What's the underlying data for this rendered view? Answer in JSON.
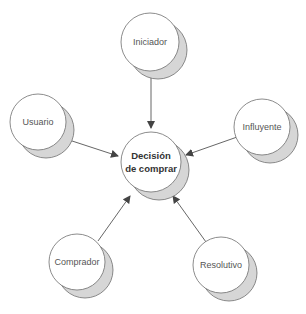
{
  "diagram": {
    "type": "role-diagram",
    "colors": {
      "circle_fill": "#ffffff",
      "circle_stroke": "#6e6e6e",
      "shadow_fill": "#d6d6d6",
      "arrow": "#555555",
      "center_text": "#333333",
      "node_text": "#555555"
    },
    "center": {
      "label_line1": "Decisión",
      "label_line2": "de comprar",
      "cx": 151,
      "cy": 162,
      "r": 30
    },
    "nodes": [
      {
        "id": "iniciador",
        "label": "Iniciador",
        "cx": 150,
        "cy": 42,
        "r": 29
      },
      {
        "id": "usuario",
        "label": "Usuario",
        "cx": 38,
        "cy": 122,
        "r": 28
      },
      {
        "id": "influyente",
        "label": "Influyente",
        "cx": 262,
        "cy": 127,
        "r": 28
      },
      {
        "id": "comprador",
        "label": "Comprador",
        "cx": 77,
        "cy": 262,
        "r": 28
      },
      {
        "id": "resolutivo",
        "label": "Resolutivo",
        "cx": 221,
        "cy": 265,
        "r": 28
      }
    ],
    "edges": [
      {
        "from": "iniciador",
        "to": "decision",
        "x1": 151,
        "y1": 71,
        "x2": 151,
        "y2": 128
      },
      {
        "from": "usuario",
        "to": "decision",
        "x1": 66,
        "y1": 139,
        "x2": 118,
        "y2": 156
      },
      {
        "from": "influyente",
        "to": "decision",
        "x1": 240,
        "y1": 136,
        "x2": 186,
        "y2": 155
      },
      {
        "from": "comprador",
        "to": "decision",
        "x1": 98,
        "y1": 241,
        "x2": 130,
        "y2": 196
      },
      {
        "from": "resolutivo",
        "to": "decision",
        "x1": 206,
        "y1": 242,
        "x2": 173,
        "y2": 196
      }
    ],
    "shadow_offset": {
      "dx": 8,
      "dy": 8
    }
  }
}
